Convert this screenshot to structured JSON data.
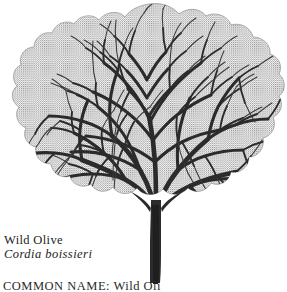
{
  "figure": {
    "common_name": "Wild Olive",
    "scientific_name": "Cordia boissieri",
    "ink_color": "#262626",
    "halftone_color": "#8c8c8c",
    "background_color": "#ffffff"
  },
  "caption": {
    "common_name": "Wild Olive",
    "scientific_name": "Cordia boissieri"
  },
  "detail_line": {
    "label": "COMMON NAME:",
    "value": "Wild Oli"
  }
}
